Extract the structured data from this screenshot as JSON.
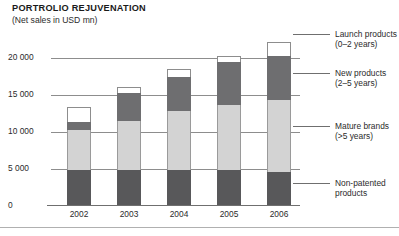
{
  "header": {
    "title": "PORTROLIO REJUVENATION",
    "subtitle": "(Net sales in USD mn)"
  },
  "legend": {
    "items": [
      {
        "name": "launch",
        "line1": "Launch products",
        "line2": "(0–2 years)",
        "color": "#ffffff"
      },
      {
        "name": "new",
        "line1": "New products",
        "line2": "(2–5 years)",
        "color": "#6e6e70"
      },
      {
        "name": "mature",
        "line1": "Mature brands",
        "line2": "(>5 years)",
        "color": "#d3d3d3"
      },
      {
        "name": "nonpatented",
        "line1": "Non-patented",
        "line2": "products",
        "color": "#58585a"
      }
    ]
  },
  "chart_data": {
    "type": "bar",
    "subtype": "stacked",
    "title": "PORTROLIO REJUVENATION",
    "subtitle": "(Net sales in USD mn)",
    "xlabel": "",
    "ylabel": "Net sales in USD mn",
    "ylim": [
      0,
      22500
    ],
    "yticks": [
      0,
      5000,
      10000,
      15000,
      20000
    ],
    "ytick_labels": [
      "0",
      "5 000",
      "10 000",
      "15 000",
      "20 000"
    ],
    "grid": true,
    "legend_position": "right",
    "categories": [
      "2002",
      "2003",
      "2004",
      "2005",
      "2006"
    ],
    "series": [
      {
        "name": "Non-patented products",
        "color": "#58585a",
        "values": [
          4700,
          4700,
          4700,
          4700,
          4450
        ]
      },
      {
        "name": "Mature brands (>5 years)",
        "color": "#d3d3d3",
        "values": [
          5470,
          6740,
          8020,
          8910,
          9800
        ]
      },
      {
        "name": "New products (2–5 years)",
        "color": "#6e6e70",
        "values": [
          1020,
          3690,
          4580,
          5730,
          5980
        ]
      },
      {
        "name": "Launch products (0–2 years)",
        "color": "#ffffff",
        "values": [
          2160,
          890,
          1150,
          890,
          1910
        ]
      }
    ],
    "totals": [
      13350,
      16020,
      18450,
      20230,
      22140
    ]
  }
}
